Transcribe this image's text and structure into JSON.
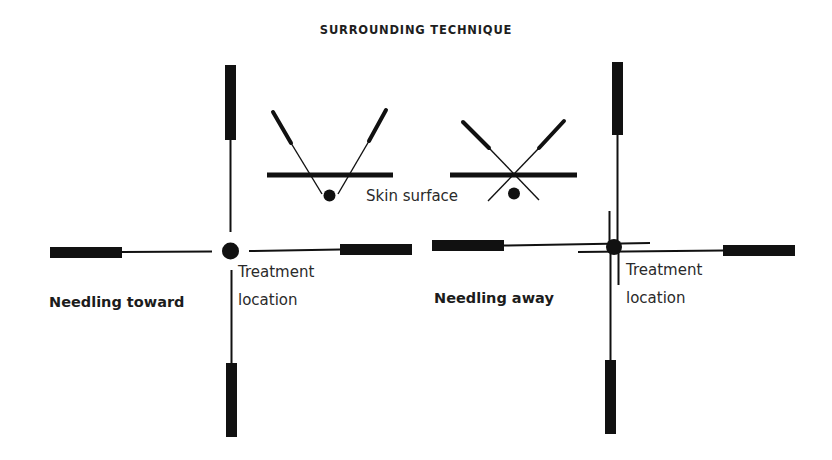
{
  "title": "SURROUNDING TECHNIQUE",
  "colors": {
    "ink": "#111111",
    "text": "#2a2a2a",
    "background": "#ffffff"
  },
  "inset": {
    "skin_surface_label": "Skin surface",
    "toward": {
      "name": "converging-needles",
      "description": "Two needles angled inward, tips converging below the skin surface at the target point"
    },
    "away": {
      "name": "crossing-needles",
      "description": "Two needles crossing above the target point at the skin surface, tips pointing away"
    }
  },
  "diagrams": [
    {
      "id": "toward",
      "caption": "Needling toward",
      "center_label_line1": "Treatment",
      "center_label_line2": "location",
      "needles": [
        "top",
        "bottom",
        "left",
        "right"
      ],
      "needle_direction": "toward center"
    },
    {
      "id": "away",
      "caption": "Needling away",
      "center_label_line1": "Treatment",
      "center_label_line2": "location",
      "needles": [
        "top",
        "bottom",
        "left",
        "right"
      ],
      "needle_direction": "past center"
    }
  ]
}
